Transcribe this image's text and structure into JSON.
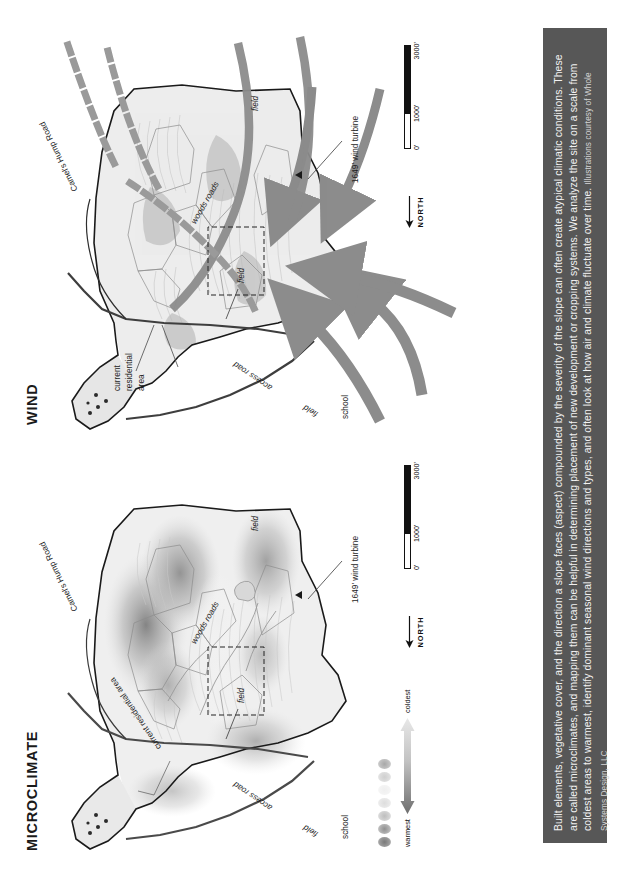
{
  "page": {
    "background": "#ffffff",
    "caption_bar_color": "#575757",
    "map_outline_color": "#1a1a1a",
    "wind_arrow_color": "#8c8c8c",
    "warmest_color": "#6e6e6e",
    "coldest_color": "#e8e8e8"
  },
  "caption": {
    "body": "Built elements, vegetative cover, and the direction a slope faces (aspect) compounded by the severity of the slope can often create atypical climatic conditions. These are called microclimates, and mapping them can be helpful in determining placement of new development or cropping systems. We analyze the site on a scale from coldest areas to warmest, identify dominant seasonal wind directions and types, and often look at how air and climate fluctuate over time.",
    "attribution": "Illustrations courtesy of Whole Systems Design, LLC"
  },
  "panels": [
    {
      "id": "microclimate",
      "title": "MICROCLIMATE",
      "labels": {
        "camels_hump_road": "Camel's Hump Road",
        "current_residential_area": "current residential area",
        "woods_roads": "woods roads",
        "access_road": "access road",
        "school": "school",
        "field_1": "field",
        "field_2": "field",
        "field_3": "field",
        "wind_turbine": "1649' wind turbine"
      },
      "north": {
        "label": "NORTH",
        "arrow": "arrow-left"
      },
      "scale": {
        "ticks": [
          "0'",
          "1000'",
          "3000'"
        ]
      },
      "legend": {
        "warmest": "warmest",
        "coldest": "coldest",
        "dot_swatches": [
          "#7a7a7a",
          "#909090",
          "#bdbdbd",
          "#dddddd",
          "#efefef",
          "#cfcfcf",
          "#a8a8a8"
        ]
      }
    },
    {
      "id": "wind",
      "title": "WIND",
      "labels": {
        "camels_hump_road": "Camel's Hump Road",
        "current_residential_area": "current\nresidential\narea",
        "current_residential_area_l1": "current",
        "current_residential_area_l2": "residential",
        "current_residential_area_l3": "area",
        "woods_roads": "woods roads",
        "access_road": "access road",
        "school": "school",
        "field_1": "field",
        "field_2": "field",
        "field_3": "field",
        "wind_turbine": "1649' wind turbine"
      },
      "north": {
        "label": "NORTH",
        "arrow": "arrow-left"
      },
      "scale": {
        "ticks": [
          "0'",
          "1000'",
          "3000'"
        ]
      }
    }
  ]
}
